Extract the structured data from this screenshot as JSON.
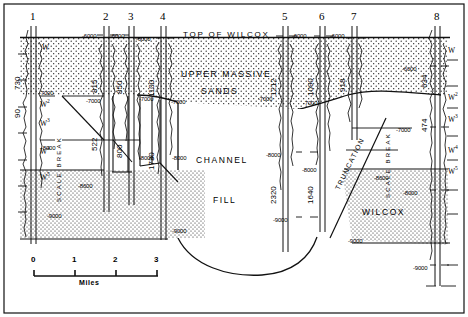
{
  "figure": {
    "type": "stratigraphic-cross-section",
    "datum_label": "TOP OF WILCOX",
    "units": {
      "upper_sand_line1": "UPPER MASSIVE",
      "upper_sand_line2": "SANDS",
      "channel_line1": "CHANNEL",
      "channel_line2": "FILL",
      "wilcox": "WILCOX"
    },
    "annotations": {
      "truncation": "TRUNCATION",
      "scale_break_left": "SCALE BREAK",
      "scale_break_right": "SCALE BREAK"
    }
  },
  "wells": [
    {
      "id": "1",
      "x": 33,
      "label": "1",
      "upper_thickness": "730",
      "lower_thickness": "90"
    },
    {
      "id": "2",
      "x": 106,
      "label": "2",
      "upper_thickness": "815",
      "lower_thickness": "522"
    },
    {
      "id": "3",
      "x": 131,
      "label": "3",
      "upper_thickness": "850",
      "lower_thickness": "800"
    },
    {
      "id": "4",
      "x": 163,
      "label": "4",
      "upper_thickness": "1100",
      "lower_thickness": "1730"
    },
    {
      "id": "5",
      "x": 285,
      "label": "5",
      "upper_thickness": "1212",
      "lower_thickness": "2320"
    },
    {
      "id": "6",
      "x": 322,
      "label": "6",
      "upper_thickness": "1090",
      "lower_thickness": "1640"
    },
    {
      "id": "7",
      "x": 354,
      "label": "7",
      "upper_thickness": "918",
      "lower_thickness": ""
    },
    {
      "id": "8",
      "x": 437,
      "label": "8",
      "upper_thickness": "634",
      "lower_thickness": "474"
    }
  ],
  "depth_labels": [
    {
      "text": "-6000",
      "x": 82,
      "y": 33
    },
    {
      "text": "-6000",
      "x": 110,
      "y": 33
    },
    {
      "text": "-6000",
      "x": 136,
      "y": 36
    },
    {
      "text": "-6000",
      "x": 292,
      "y": 33
    },
    {
      "text": "-6000",
      "x": 330,
      "y": 33
    },
    {
      "text": "-6000",
      "x": 402,
      "y": 66
    },
    {
      "text": "-7000",
      "x": 39,
      "y": 90
    },
    {
      "text": "-7000",
      "x": 86,
      "y": 98
    },
    {
      "text": "-7000",
      "x": 139,
      "y": 96
    },
    {
      "text": "-7000",
      "x": 171,
      "y": 99
    },
    {
      "text": "-7000",
      "x": 258,
      "y": 96
    },
    {
      "text": "-7000",
      "x": 303,
      "y": 100
    },
    {
      "text": "-7000",
      "x": 396,
      "y": 127
    },
    {
      "text": "-8000",
      "x": 41,
      "y": 145
    },
    {
      "text": "-8000",
      "x": 139,
      "y": 155
    },
    {
      "text": "-8000",
      "x": 172,
      "y": 155
    },
    {
      "text": "-8000",
      "x": 266,
      "y": 152
    },
    {
      "text": "-8000",
      "x": 302,
      "y": 167
    },
    {
      "text": "-8000",
      "x": 403,
      "y": 190
    },
    {
      "text": "-8600",
      "x": 78,
      "y": 183
    },
    {
      "text": "-8600",
      "x": 374,
      "y": 175
    },
    {
      "text": "-9000",
      "x": 47,
      "y": 213
    },
    {
      "text": "-9000",
      "x": 172,
      "y": 228
    },
    {
      "text": "-9000",
      "x": 273,
      "y": 217
    },
    {
      "text": "-9000",
      "x": 348,
      "y": 238
    },
    {
      "text": "-9000",
      "x": 413,
      "y": 265
    }
  ],
  "unit_markers": [
    {
      "text": "W",
      "sup": "",
      "x": 42,
      "y": 44
    },
    {
      "text": "W",
      "sup": "2",
      "x": 40,
      "y": 99
    },
    {
      "text": "W",
      "sup": "3",
      "x": 40,
      "y": 118
    },
    {
      "text": "W",
      "sup": "4",
      "x": 40,
      "y": 146
    },
    {
      "text": "W",
      "sup": "5",
      "x": 40,
      "y": 172
    },
    {
      "text": "W",
      "sup": "",
      "x": 448,
      "y": 47
    },
    {
      "text": "W",
      "sup": "2",
      "x": 448,
      "y": 92
    },
    {
      "text": "W",
      "sup": "3",
      "x": 448,
      "y": 114
    },
    {
      "text": "W",
      "sup": "4",
      "x": 448,
      "y": 145
    },
    {
      "text": "W",
      "sup": "5",
      "x": 448,
      "y": 166
    }
  ],
  "scale_bar": {
    "ticks": [
      "0",
      "1",
      "2",
      "3"
    ],
    "caption": "Miles"
  }
}
